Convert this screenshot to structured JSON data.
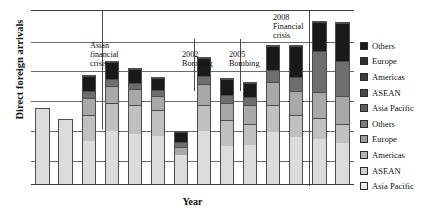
{
  "chart_data": {
    "type": "bar",
    "stacked": true,
    "title": "",
    "xlabel": "Year",
    "ylabel": "Direct foreign arrivals",
    "grid": true,
    "gridlines": 5,
    "ylim": [
      0,
      100
    ],
    "axis_tick_labels": [],
    "legend_position": "right",
    "categories": [
      "1",
      "2",
      "3",
      "4",
      "5",
      "6",
      "7",
      "8",
      "9",
      "10",
      "11",
      "12",
      "13",
      "14"
    ],
    "series": [
      {
        "name": "Asia Pacific",
        "color": "#dcdcdc",
        "values": [
          44,
          38,
          25,
          31,
          29,
          28,
          17,
          31,
          22,
          23,
          30,
          27,
          26,
          24
        ]
      },
      {
        "name": "ASEAN",
        "color": "#c0c0c0",
        "values": [
          0,
          0,
          15,
          16,
          17,
          15,
          0,
          15,
          15,
          12,
          16,
          13,
          12,
          11
        ]
      },
      {
        "name": "Americas",
        "color": "#a8a8a8",
        "values": [
          0,
          0,
          10,
          10,
          9,
          8,
          5,
          12,
          10,
          11,
          13,
          14,
          15,
          16
        ]
      },
      {
        "name": "Europe",
        "color": "#6e6e6e",
        "values": [
          0,
          0,
          4,
          4,
          4,
          4,
          3,
          5,
          5,
          5,
          7,
          8,
          24,
          20
        ]
      },
      {
        "name": "Others",
        "color": "#1a1a1a",
        "values": [
          0,
          0,
          9,
          10,
          8,
          7,
          6,
          10,
          9,
          8,
          14,
          18,
          17,
          22
        ]
      }
    ],
    "annotations": [
      {
        "id": "asian-financial-crisis",
        "text": "Asian\nfinancial\ncrisis",
        "marker_bar": 3
      },
      {
        "id": "bombing-2002",
        "text": "2002\nBombing",
        "marker_bar": 7
      },
      {
        "id": "bombing-2005",
        "text": "2005\nBombing",
        "marker_bar": 9
      },
      {
        "id": "financial-crisis-2008",
        "text": "2008\nFinancial\ncrisis",
        "marker_bar": 12
      }
    ]
  },
  "legend": {
    "items": [
      {
        "label": "Others",
        "color": "#1a1a1a"
      },
      {
        "label": "Europe",
        "color": "#303030"
      },
      {
        "label": "Americas",
        "color": "#3c3c3c"
      },
      {
        "label": "ASEAN",
        "color": "#4a4a4a"
      },
      {
        "label": "Asia Pacific",
        "color": "#5e5e5e"
      },
      {
        "label": "Others",
        "color": "#7c7c7c"
      },
      {
        "label": "Europe",
        "color": "#9a9a9a"
      },
      {
        "label": "Americas",
        "color": "#b4b4b4"
      },
      {
        "label": "ASEAN",
        "color": "#cfcfcf"
      },
      {
        "label": "Asia Pacific",
        "color": "#ebebeb"
      }
    ]
  }
}
